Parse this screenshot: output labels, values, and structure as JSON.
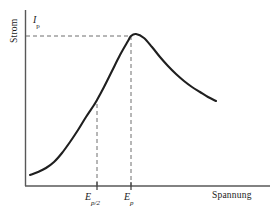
{
  "chart_data": {
    "type": "line",
    "title": "",
    "xlabel": "Spannung",
    "ylabel": "Strom",
    "grid": false,
    "legend": null,
    "axis_style": "open-corner-arrowless",
    "annotations": [
      {
        "name": "peak-current",
        "base": "I",
        "subscript": "p",
        "text": "Ip",
        "axis": "y",
        "guide": "horizontal-dashed"
      },
      {
        "name": "half-peak-potential",
        "base": "E",
        "subscript": "p/2",
        "text": "Ep/2",
        "axis": "x",
        "guide": "vertical-dashed"
      },
      {
        "name": "peak-potential",
        "base": "E",
        "subscript": "p",
        "text": "Ep",
        "axis": "x",
        "guide": "vertical-dashed"
      }
    ],
    "xticks": [
      {
        "label_base": "E",
        "label_sub": "p/2",
        "x_px": 97
      },
      {
        "label_base": "E",
        "label_sub": "p",
        "x_px": 131
      }
    ],
    "curve_points_px": [
      [
        30,
        175
      ],
      [
        38,
        172
      ],
      [
        46,
        168
      ],
      [
        54,
        162
      ],
      [
        62,
        153
      ],
      [
        70,
        142
      ],
      [
        78,
        130
      ],
      [
        86,
        117
      ],
      [
        94,
        105
      ],
      [
        97,
        100
      ],
      [
        104,
        87
      ],
      [
        112,
        71
      ],
      [
        120,
        55
      ],
      [
        128,
        41
      ],
      [
        131,
        36
      ],
      [
        136,
        34
      ],
      [
        144,
        38
      ],
      [
        152,
        47
      ],
      [
        160,
        57
      ],
      [
        168,
        66
      ],
      [
        176,
        74
      ],
      [
        184,
        81
      ],
      [
        192,
        87
      ],
      [
        200,
        92
      ],
      [
        208,
        97
      ],
      [
        216,
        101
      ]
    ],
    "axis_ranges": {
      "x_axis_px": [
        25,
        270
      ],
      "y_axis_px": [
        10,
        186
      ]
    },
    "peak_px": [
      131,
      36
    ],
    "half_peak_px": [
      97,
      104
    ],
    "colors": {
      "curve": "#1f1f1f",
      "axis": "#4d4d4d",
      "dashed_guide": "#6b6b6b",
      "text": "#1a1a1a",
      "background": "#ffffff"
    }
  },
  "labels": {
    "y_axis": "Strom",
    "x_axis": "Spannung",
    "peak_current_base": "I",
    "peak_current_sub": "p",
    "half_peak_base": "E",
    "half_peak_sub": "p/2",
    "peak_potential_base": "E",
    "peak_potential_sub": "p"
  }
}
